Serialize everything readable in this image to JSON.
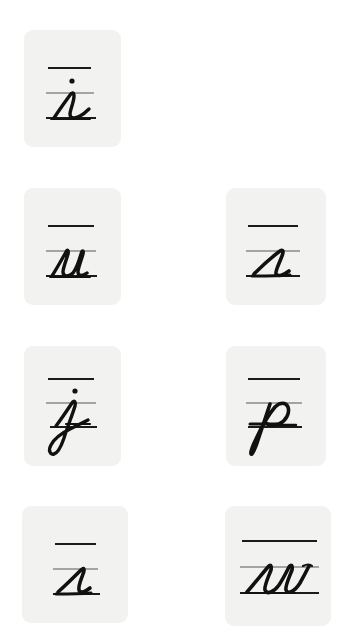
{
  "page": {
    "background_color": "#ffffff",
    "width": 340,
    "height": 633,
    "grid_columns": 2,
    "grid_rows": 4,
    "card_count": 8
  },
  "style": {
    "card_fill": "#f2f2f1",
    "card_corner_radius": "9px",
    "top_line_color": "#1b1b1b",
    "midline_color": "#8a8a8a",
    "baseline_color": "#1b1b1b",
    "glyph_color": "#111111"
  },
  "cards": [
    {
      "id": "card-i",
      "letter": "i",
      "letter_name": "cursive lowercase i",
      "script": "cursive",
      "case": "lowercase",
      "has_dot": true,
      "has_ascender": false,
      "has_descender": false,
      "row": 1,
      "column": 1,
      "guide_lines": 3,
      "guide_line_labels": [
        "top line",
        "midline",
        "baseline"
      ]
    },
    {
      "id": "card-t",
      "letter": "t",
      "letter_name": "cursive lowercase t",
      "script": "cursive",
      "case": "lowercase",
      "has_dot": false,
      "has_ascender": true,
      "has_descender": false,
      "row": 1,
      "column": 2,
      "guide_lines": 3,
      "guide_line_labels": [
        "top line",
        "midline",
        "baseline"
      ]
    },
    {
      "id": "card-u",
      "letter": "u",
      "letter_name": "cursive lowercase u",
      "script": "cursive",
      "case": "lowercase",
      "has_dot": false,
      "has_ascender": false,
      "has_descender": false,
      "row": 2,
      "column": 1,
      "guide_lines": 3,
      "guide_line_labels": [
        "top line",
        "midline",
        "baseline"
      ]
    },
    {
      "id": "card-s",
      "letter": "s",
      "letter_name": "cursive lowercase s",
      "script": "cursive",
      "case": "lowercase",
      "has_dot": false,
      "has_ascender": false,
      "has_descender": false,
      "row": 2,
      "column": 2,
      "guide_lines": 3,
      "guide_line_labels": [
        "top line",
        "midline",
        "baseline"
      ]
    },
    {
      "id": "card-j",
      "letter": "j",
      "letter_name": "cursive lowercase j",
      "script": "cursive",
      "case": "lowercase",
      "has_dot": true,
      "has_ascender": false,
      "has_descender": true,
      "row": 3,
      "column": 1,
      "guide_lines": 3,
      "guide_line_labels": [
        "top line",
        "midline",
        "baseline"
      ]
    },
    {
      "id": "card-p",
      "letter": "p",
      "letter_name": "cursive lowercase p",
      "script": "cursive",
      "case": "lowercase",
      "has_dot": false,
      "has_ascender": false,
      "has_descender": true,
      "row": 3,
      "column": 2,
      "guide_lines": 3,
      "guide_line_labels": [
        "top line",
        "midline",
        "baseline"
      ]
    },
    {
      "id": "card-r",
      "letter": "r",
      "letter_name": "cursive lowercase r",
      "script": "cursive",
      "case": "lowercase",
      "has_dot": false,
      "has_ascender": false,
      "has_descender": false,
      "row": 4,
      "column": 1,
      "guide_lines": 3,
      "guide_line_labels": [
        "top line",
        "midline",
        "baseline"
      ]
    },
    {
      "id": "card-w",
      "letter": "w",
      "letter_name": "cursive lowercase w",
      "script": "cursive",
      "case": "lowercase",
      "has_dot": false,
      "has_ascender": false,
      "has_descender": false,
      "row": 4,
      "column": 2,
      "guide_lines": 3,
      "guide_line_labels": [
        "top line",
        "midline",
        "baseline"
      ]
    }
  ]
}
